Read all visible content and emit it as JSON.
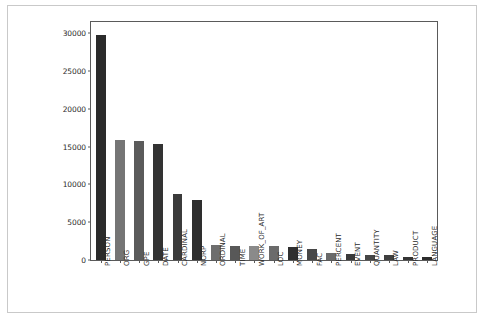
{
  "chart_data": {
    "type": "bar",
    "title": "",
    "subtitle": "",
    "xlabel": "",
    "ylabel": "",
    "grid": false,
    "legend": "none",
    "ylim": [
      0,
      31500
    ],
    "yticks": [
      0,
      5000,
      10000,
      15000,
      20000,
      25000,
      30000
    ],
    "ytick_labels": [
      "0",
      "5000",
      "10000",
      "15000",
      "20000",
      "25000",
      "30000"
    ],
    "categories": [
      "PERSON",
      "ORG",
      "GPE",
      "DATE",
      "CARDINAL",
      "NORP",
      "ORDINAL",
      "TIME",
      "WORK_OF_ART",
      "LOC",
      "MONEY",
      "FAC",
      "PERCENT",
      "EVENT",
      "QUANTITY",
      "LAW",
      "PRODUCT",
      "LANGUAGE"
    ],
    "values": [
      29800,
      15900,
      15800,
      15300,
      8800,
      7950,
      1950,
      1850,
      1800,
      1800,
      1700,
      1500,
      950,
      750,
      700,
      700,
      450,
      400
    ],
    "bar_colors": [
      "#2b2b2b",
      "#757575",
      "#5b5b5b",
      "#333333",
      "#3b3b3b",
      "#2e2e2e",
      "#6e6e6e",
      "#585858",
      "#8a8a8a",
      "#6b6b6b",
      "#2f2f2f",
      "#474747",
      "#6a6a6a",
      "#3a3a3a",
      "#464646",
      "#3f3f3f",
      "#353535",
      "#2d2d2d"
    ],
    "axis_color": "#5a5a5a",
    "background_color": "#ffffff",
    "frame_color": "#c9c9c9"
  }
}
